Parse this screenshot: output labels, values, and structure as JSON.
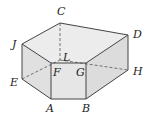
{
  "figure": {
    "type": "prism-solid",
    "colors": {
      "edge": "#444444",
      "top_face": "#ececec",
      "side_face": "#dedede",
      "front_face": "#e4e4e4",
      "background": "#ffffff"
    },
    "vertices": {
      "C": {
        "label": "C",
        "x": 60,
        "y": 23,
        "lx": 57,
        "ly": 15
      },
      "D": {
        "label": "D",
        "x": 128,
        "y": 35,
        "lx": 134,
        "ly": 38
      },
      "J": {
        "label": "J",
        "x": 22,
        "y": 44,
        "lx": 11,
        "ly": 47
      },
      "L": {
        "label": "L",
        "x": 60,
        "y": 60,
        "lx": 64,
        "ly": 60
      },
      "F": {
        "label": "F",
        "x": 51,
        "y": 63,
        "lx": 53,
        "ly": 76
      },
      "G": {
        "label": "G",
        "x": 86,
        "y": 63,
        "lx": 76,
        "ly": 76
      },
      "H": {
        "label": "H",
        "x": 128,
        "y": 70,
        "lx": 133,
        "ly": 75
      },
      "E": {
        "label": "E",
        "x": 22,
        "y": 79,
        "lx": 10,
        "ly": 86
      },
      "A": {
        "label": "A",
        "x": 51,
        "y": 99,
        "lx": 46,
        "ly": 112
      },
      "B": {
        "label": "B",
        "x": 86,
        "y": 99,
        "lx": 82,
        "ly": 112
      }
    }
  }
}
